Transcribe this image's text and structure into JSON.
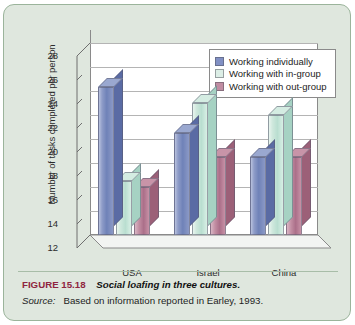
{
  "caption": {
    "figure_number": "FIGURE 15.18",
    "title": "Social loafing in three cultures.",
    "source_label": "Source:",
    "source_text": "Based on information reported in Earley, 1993."
  },
  "colors": {
    "panel_background": "#dfe7de",
    "panel_border": "#9bb49b",
    "plot_background": "#ffffff",
    "figure_number": "#8f2540",
    "series_individually": "#8190c4",
    "series_in_group": "#dceee6",
    "series_out_group": "#c08ca2"
  },
  "chart_data": {
    "type": "bar",
    "title": "",
    "xlabel": "",
    "ylabel": "Number of tasks completed per person",
    "categories": [
      "USA",
      "Israel",
      "China"
    ],
    "ylim": [
      12,
      28
    ],
    "yticks": [
      12,
      14,
      16,
      18,
      20,
      22,
      24,
      26,
      28
    ],
    "grid": true,
    "legend_position": "top-right-inside",
    "three_d": true,
    "series": [
      {
        "name": "Working individually",
        "values": [
          24.3,
          20.5,
          18.5
        ]
      },
      {
        "name": "Working with in-group",
        "values": [
          16.5,
          23.0,
          22.0
        ]
      },
      {
        "name": "Working with out-group",
        "values": [
          16.0,
          18.5,
          18.5
        ]
      }
    ]
  }
}
